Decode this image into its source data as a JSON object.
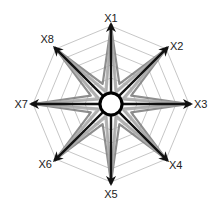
{
  "diagram": {
    "type": "radar-star",
    "center": [
      111,
      104
    ],
    "outer_radius": 78,
    "ring_count": 6,
    "hub_radius": 11,
    "colors": {
      "grid": "#b8b8b8",
      "axis": "#111111",
      "star_light": "#a8a8a8",
      "star_mid": "#7a7a7a",
      "hub_fill": "#ffffff",
      "hub_stroke": "#000000",
      "label": "#222222"
    }
  },
  "chart_data": {
    "type": "radar",
    "title": "",
    "axes": [
      "X1",
      "X2",
      "X3",
      "X4",
      "X5",
      "X6",
      "X7",
      "X8"
    ],
    "grid": {
      "shape": "octagon",
      "rings": 6
    },
    "series": [
      {
        "name": "axis-arrows",
        "values": [
          1,
          1,
          1,
          1,
          1,
          1,
          1,
          1
        ],
        "style": "black arrows"
      },
      {
        "name": "star-inner-a",
        "inner_ratio": 0.28,
        "style": "gray star polygon"
      },
      {
        "name": "star-inner-b",
        "inner_ratio": 0.18,
        "style": "light gray star polygon"
      }
    ],
    "legend": null
  },
  "labels": {
    "x1": "X1",
    "x2": "X2",
    "x3": "X3",
    "x4": "X4",
    "x5": "X5",
    "x6": "X6",
    "x7": "X7",
    "x8": "X8"
  }
}
